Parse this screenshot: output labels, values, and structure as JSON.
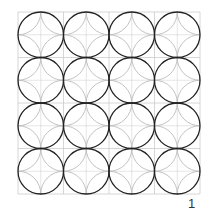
{
  "figure": {
    "grid": {
      "rows": 4,
      "cols": 4,
      "x0": 18,
      "y0": 12,
      "cell": 45.5,
      "line_color": "#cccccc"
    },
    "main_circles": {
      "stroke": "#222222",
      "stroke_width": 1.3
    },
    "corner_arcs": {
      "stroke": "#bbbbbb",
      "stroke_width": 0.9
    }
  },
  "page_number": "1"
}
